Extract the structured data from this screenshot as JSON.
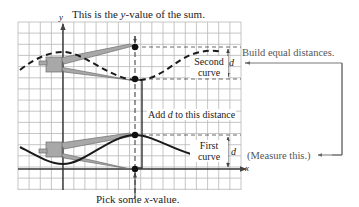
{
  "title_label": {
    "var": "y",
    "text_pre": "This is the ",
    "text_var": "y",
    "text_post": "-value of the sum."
  },
  "bottom_label": {
    "text_pre": "Pick some ",
    "text_var": "x",
    "text_post": "-value."
  },
  "curve_labels": {
    "second": [
      "Second",
      "curve"
    ],
    "first": [
      "First",
      "curve"
    ]
  },
  "add_label": {
    "pre": "Add ",
    "var": "d",
    "post": " to this distance"
  },
  "distance_symbol": "d",
  "side_notes": {
    "build": "Build equal distances.",
    "measure": "(Measure this.)"
  },
  "axes": {
    "x": "x",
    "y": "y"
  },
  "colors": {
    "grid": "#b8b8b8",
    "axis": "#333333",
    "curve": "#1a1a1a",
    "compass_fill": "#a8a8a8",
    "compass_stroke": "#6e6e6e",
    "note_text": "#555555"
  },
  "geometry": {
    "grid": {
      "x0": 18,
      "y0": 22,
      "x1": 241,
      "y1": 190,
      "cell": 11.15
    },
    "y_axis_x": 63,
    "x_axis_y": 169,
    "chosen_x": 135,
    "points": [
      {
        "name": "sum-point",
        "y": 47
      },
      {
        "name": "second-curve-point",
        "y": 79
      },
      {
        "name": "first-curve-point",
        "y": 135
      },
      {
        "name": "x-axis-point",
        "y": 169
      }
    ]
  }
}
